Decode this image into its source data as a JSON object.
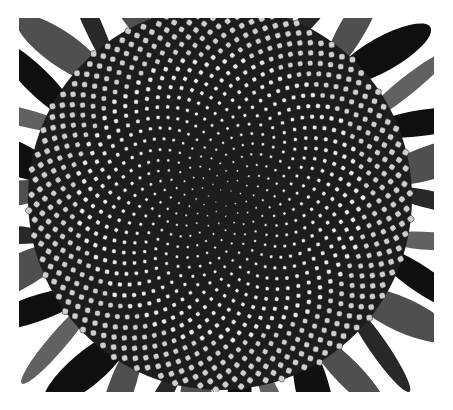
{
  "image": {
    "subject": "sunflower head seed spirals (black and white photograph)",
    "frame": {
      "x": 19,
      "y": 18,
      "width": 415,
      "height": 374
    },
    "colors": {
      "page_bg": "#ffffff",
      "photo_bg": "#e6e6e6",
      "disc_bg": "#2a2a2a",
      "seed_fill": "#dcdcdc",
      "seed_stroke": "#1c1c1c",
      "petal_dark": "#1e1e1e",
      "petal_light": "#f2f2f2"
    }
  },
  "sunflower": {
    "center": {
      "x": 201,
      "y": 180
    },
    "radius": 192,
    "seed_count": 1100,
    "golden_angle_deg": 137.508
  },
  "petals": {
    "count": 34
  }
}
